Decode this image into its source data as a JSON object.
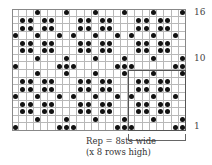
{
  "chart": {
    "columns": 24,
    "rows": 16,
    "colors": {
      "dot": "#111111",
      "grid": "#b8b8b8",
      "frame": "#888888"
    },
    "row_labels": [
      {
        "row": 16,
        "label": "16"
      },
      {
        "row": 10,
        "label": "10"
      },
      {
        "row": 1,
        "label": "1"
      }
    ],
    "dots_by_row": {
      "16": [
        3,
        7,
        11,
        15,
        19,
        23
      ],
      "15": [
        1,
        2,
        4,
        5,
        9,
        10,
        12,
        13,
        17,
        18,
        20,
        21
      ],
      "14": [
        1,
        2,
        4,
        5,
        9,
        10,
        12,
        13,
        17,
        18,
        20,
        21
      ],
      "13": [
        0,
        3,
        6,
        8,
        11,
        14,
        16,
        19,
        22
      ],
      "12": [
        1,
        2,
        4,
        5,
        9,
        10,
        12,
        13,
        17,
        18,
        20,
        21
      ],
      "11": [
        1,
        2,
        4,
        5,
        9,
        10,
        12,
        13,
        17,
        18,
        20,
        21
      ],
      "10": [
        3,
        7,
        11,
        15,
        19,
        23
      ],
      "9": [
        0,
        6,
        7,
        8,
        14,
        15,
        16,
        22,
        23
      ],
      "8": [
        3,
        7,
        11,
        15,
        19,
        23
      ],
      "7": [
        1,
        2,
        4,
        5,
        9,
        10,
        12,
        13,
        17,
        18,
        20,
        21
      ],
      "6": [
        1,
        2,
        4,
        5,
        9,
        10,
        12,
        13,
        17,
        18,
        20,
        21
      ],
      "5": [
        0,
        3,
        6,
        8,
        11,
        14,
        16,
        19,
        22
      ],
      "4": [
        1,
        2,
        4,
        5,
        9,
        10,
        12,
        13,
        17,
        18,
        20,
        21
      ],
      "3": [
        1,
        2,
        4,
        5,
        9,
        10,
        12,
        13,
        17,
        18,
        20,
        21
      ],
      "2": [
        3,
        7,
        11,
        15,
        19,
        23
      ],
      "1": [
        0,
        6,
        7,
        8,
        14,
        15,
        16,
        22,
        23
      ]
    },
    "repeat_box": {
      "col_start": 16,
      "col_end": 23,
      "row_start": 1,
      "row_end": 8
    }
  },
  "legend": {
    "line1": "Rep = 8sts wide",
    "line2": "(x 8 rows high)"
  }
}
